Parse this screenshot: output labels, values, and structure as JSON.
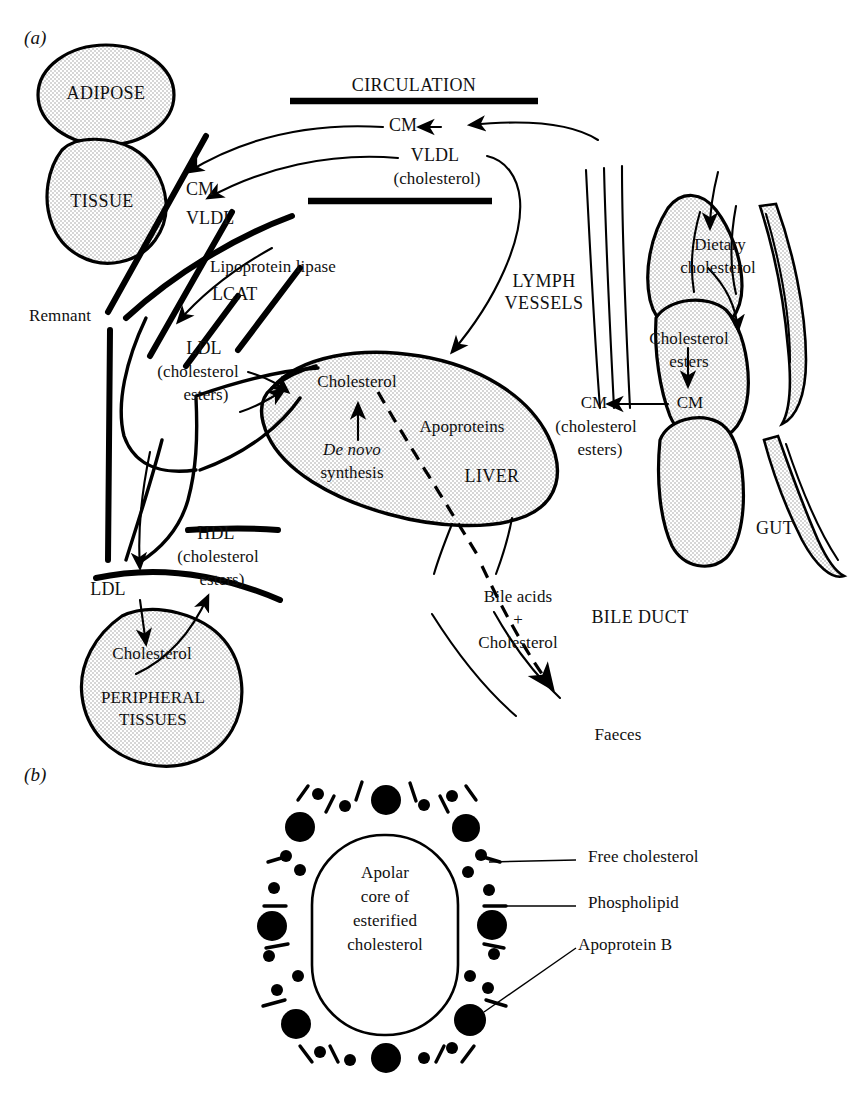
{
  "figure": {
    "panel_a_tag": "(a)",
    "panel_b_tag": "(b)"
  },
  "panel_a": {
    "labels": {
      "adipose": "ADIPOSE",
      "tissue": "TISSUE",
      "circulation": "CIRCULATION",
      "cm_top": "CM",
      "vldl_top": "VLDL",
      "vldl_top_sub": "(cholesterol)",
      "cm_left": "CM",
      "vldl_left": "VLDL",
      "lipoprotein_lipase": "Lipoprotein lipase",
      "lcat": "LCAT",
      "remnant": "Remnant",
      "ldl_upper": "LDL",
      "ldl_upper_sub1": "(cholesterol",
      "ldl_upper_sub2": "esters)",
      "hdl": "HDL",
      "hdl_sub1": "(cholesterol",
      "hdl_sub2": "esters)",
      "ldl_lower": "LDL",
      "peripheral_cholesterol": "Cholesterol",
      "peripheral_tissues_l1": "PERIPHERAL",
      "peripheral_tissues_l2": "TISSUES",
      "liver_cholesterol": "Cholesterol",
      "de_novo": "De novo",
      "synthesis": "synthesis",
      "apoproteins": "Apoproteins",
      "liver": "LIVER",
      "lymph_l1": "LYMPH",
      "lymph_l2": "VESSELS",
      "dietary_l1": "Dietary",
      "dietary_l2": "cholesterol",
      "chol_esters_l1": "Cholesterol",
      "chol_esters_l2": "esters",
      "cm_gut_inner": "CM",
      "cm_gut_outer": "CM",
      "cm_gut_sub1": "(cholesterol",
      "cm_gut_sub2": "esters)",
      "gut": "GUT",
      "bile_acids": "Bile acids",
      "plus": "+",
      "bile_cholesterol": "Cholesterol",
      "bile_duct": "BILE DUCT",
      "faeces": "Faeces"
    }
  },
  "panel_b": {
    "core_l1": "Apolar",
    "core_l2": "core of",
    "core_l3": "esterified",
    "core_l4": "cholesterol",
    "legend": {
      "free_cholesterol": "Free cholesterol",
      "phospholipid": "Phospholipid",
      "apoprotein_b": "Apoprotein B"
    }
  },
  "colors": {
    "ink": "#111111",
    "organ_fill": "#e9e9e9",
    "background": "#ffffff"
  }
}
